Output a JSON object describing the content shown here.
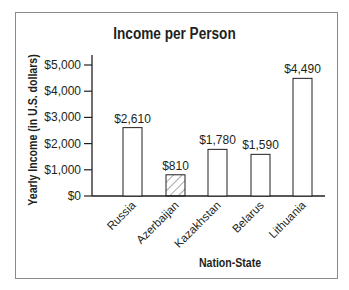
{
  "chart_data": {
    "type": "bar",
    "title": "Income per Person",
    "xlabel": "Nation-State",
    "ylabel": "Yearly Income (in U.S. dollars)",
    "categories": [
      "Russia",
      "Azerbaijan",
      "Kazakhstan",
      "Belarus",
      "Lithuania"
    ],
    "values": [
      2610,
      810,
      1780,
      1590,
      4490
    ],
    "value_labels": [
      "$2,610",
      "$810",
      "$1,780",
      "$1,590",
      "$4,490"
    ],
    "highlighted": [
      "Azerbaijan"
    ],
    "bar_styles": [
      "plain",
      "hatched",
      "plain",
      "plain",
      "plain"
    ],
    "yticks": [
      0,
      1000,
      2000,
      3000,
      4000,
      5000
    ],
    "ytick_labels": [
      "$0",
      "$1,000",
      "$2,000",
      "$3,000",
      "$4,000",
      "$5,000"
    ],
    "ylim": [
      0,
      5000
    ],
    "grid": false,
    "legend": null
  }
}
